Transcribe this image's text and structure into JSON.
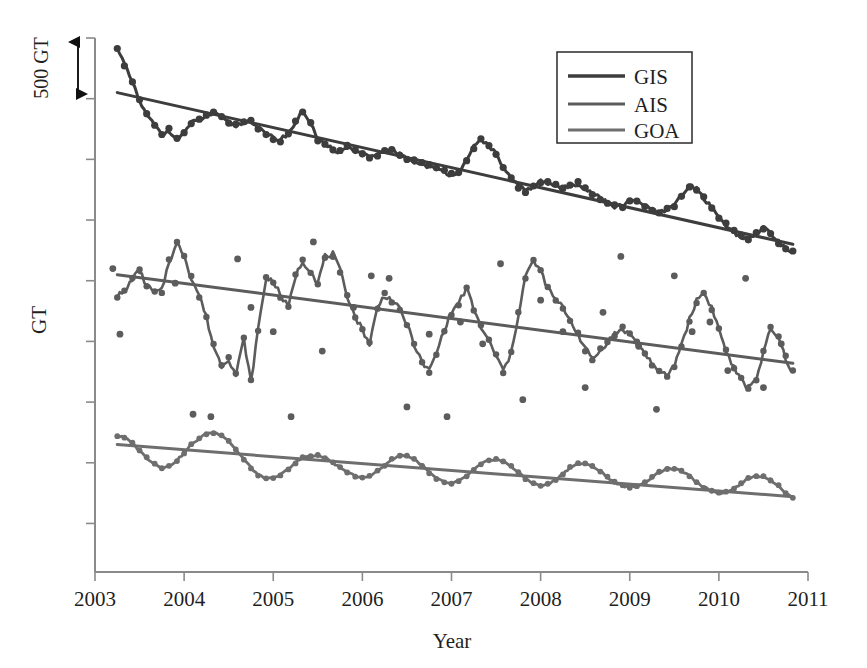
{
  "chart_data": {
    "type": "line",
    "title": "",
    "xlabel": "Year",
    "ylabel": "GT",
    "xlim": [
      2003,
      2011
    ],
    "ylim": [
      0,
      4400
    ],
    "grid": false,
    "legend_position": "top-right",
    "y_axis_note": "No numeric y tick labels; vertical scale indicated by a 500 GT double-headed arrow scale bar near the top of the axis",
    "scalebar": {
      "label": "500 GT",
      "value": 500,
      "units": "GT"
    },
    "xticks": [
      "2003",
      "2004",
      "2005",
      "2006",
      "2007",
      "2008",
      "2009",
      "2010",
      "2011"
    ],
    "yticks": [],
    "series": [
      {
        "name": "GIS",
        "color": "#3d3d3d",
        "style": "line+markers with linear trend line",
        "trend": {
          "start": 3950,
          "end": 2700
        },
        "x": [
          2003.25,
          2003.33,
          2003.42,
          2003.5,
          2003.58,
          2003.67,
          2003.75,
          2003.83,
          2003.92,
          2004.0,
          2004.08,
          2004.17,
          2004.25,
          2004.33,
          2004.42,
          2004.5,
          2004.58,
          2004.67,
          2004.75,
          2004.83,
          2004.92,
          2005.0,
          2005.08,
          2005.17,
          2005.25,
          2005.33,
          2005.42,
          2005.5,
          2005.58,
          2005.67,
          2005.75,
          2005.83,
          2005.92,
          2006.0,
          2006.08,
          2006.17,
          2006.25,
          2006.33,
          2006.42,
          2006.5,
          2006.58,
          2006.67,
          2006.75,
          2006.83,
          2006.92,
          2007.0,
          2007.08,
          2007.17,
          2007.25,
          2007.33,
          2007.42,
          2007.5,
          2007.58,
          2007.67,
          2007.75,
          2007.83,
          2007.92,
          2008.0,
          2008.08,
          2008.17,
          2008.25,
          2008.33,
          2008.42,
          2008.5,
          2008.58,
          2008.67,
          2008.75,
          2008.83,
          2008.92,
          2009.0,
          2009.08,
          2009.17,
          2009.25,
          2009.33,
          2009.42,
          2009.5,
          2009.58,
          2009.67,
          2009.75,
          2009.83,
          2009.92,
          2010.0,
          2010.08,
          2010.17,
          2010.25,
          2010.33,
          2010.42,
          2010.5,
          2010.58,
          2010.67,
          2010.75,
          2010.83
        ],
        "values": [
          4330,
          4180,
          4030,
          3880,
          3760,
          3680,
          3600,
          3640,
          3570,
          3620,
          3700,
          3720,
          3760,
          3780,
          3740,
          3700,
          3680,
          3700,
          3720,
          3660,
          3600,
          3580,
          3560,
          3620,
          3700,
          3800,
          3700,
          3560,
          3520,
          3480,
          3460,
          3500,
          3470,
          3440,
          3420,
          3430,
          3460,
          3480,
          3440,
          3400,
          3380,
          3360,
          3340,
          3320,
          3300,
          3270,
          3300,
          3380,
          3500,
          3560,
          3520,
          3440,
          3340,
          3240,
          3180,
          3140,
          3180,
          3220,
          3200,
          3180,
          3160,
          3180,
          3200,
          3160,
          3120,
          3080,
          3040,
          3010,
          3020,
          3050,
          3060,
          3020,
          2980,
          2960,
          2980,
          3020,
          3100,
          3180,
          3160,
          3080,
          3000,
          2920,
          2860,
          2800,
          2760,
          2740,
          2780,
          2840,
          2800,
          2720,
          2660,
          2640
        ]
      },
      {
        "name": "AIS",
        "color": "#5c5c5c",
        "style": "line+markers with scattered outlier points and linear trend line",
        "trend": {
          "start": 2450,
          "end": 1720
        },
        "x": [
          2003.25,
          2003.33,
          2003.42,
          2003.5,
          2003.58,
          2003.67,
          2003.75,
          2003.83,
          2003.92,
          2004.0,
          2004.08,
          2004.17,
          2004.25,
          2004.33,
          2004.42,
          2004.5,
          2004.58,
          2004.67,
          2004.75,
          2004.83,
          2004.92,
          2005.0,
          2005.08,
          2005.17,
          2005.25,
          2005.33,
          2005.42,
          2005.5,
          2005.58,
          2005.67,
          2005.75,
          2005.83,
          2005.92,
          2006.0,
          2006.08,
          2006.17,
          2006.25,
          2006.33,
          2006.42,
          2006.5,
          2006.58,
          2006.67,
          2006.75,
          2006.83,
          2006.92,
          2007.0,
          2007.08,
          2007.17,
          2007.25,
          2007.33,
          2007.42,
          2007.5,
          2007.58,
          2007.67,
          2007.75,
          2007.83,
          2007.92,
          2008.0,
          2008.08,
          2008.17,
          2008.25,
          2008.33,
          2008.42,
          2008.5,
          2008.58,
          2008.67,
          2008.75,
          2008.83,
          2008.92,
          2009.0,
          2009.08,
          2009.17,
          2009.25,
          2009.33,
          2009.42,
          2009.5,
          2009.58,
          2009.67,
          2009.75,
          2009.83,
          2009.92,
          2010.0,
          2010.08,
          2010.17,
          2010.25,
          2010.33,
          2010.42,
          2010.5,
          2010.58,
          2010.67,
          2010.75,
          2010.83
        ],
        "values": [
          2280,
          2300,
          2420,
          2480,
          2360,
          2300,
          2320,
          2560,
          2700,
          2620,
          2420,
          2280,
          2100,
          1860,
          1700,
          1760,
          1620,
          1920,
          1560,
          2000,
          2420,
          2400,
          2280,
          2180,
          2440,
          2560,
          2480,
          2380,
          2600,
          2620,
          2480,
          2280,
          2100,
          2000,
          1880,
          2180,
          2280,
          2240,
          2160,
          2040,
          1880,
          1720,
          1660,
          1800,
          2000,
          2140,
          2220,
          2340,
          2160,
          2020,
          1900,
          1780,
          1660,
          1800,
          2120,
          2440,
          2560,
          2480,
          2340,
          2240,
          2180,
          2080,
          1960,
          1840,
          1760,
          1820,
          1900,
          1960,
          2000,
          1960,
          1880,
          1800,
          1720,
          1640,
          1620,
          1700,
          1880,
          2080,
          2240,
          2300,
          2180,
          2000,
          1820,
          1680,
          1580,
          1520,
          1600,
          1800,
          2000,
          1920,
          1760,
          1640
        ],
        "outliers_x": [
          2003.2,
          2003.28,
          2003.9,
          2004.1,
          2004.3,
          2004.6,
          2004.75,
          2005.0,
          2005.2,
          2005.45,
          2005.55,
          2005.9,
          2006.1,
          2006.3,
          2006.5,
          2006.75,
          2006.95,
          2007.1,
          2007.35,
          2007.55,
          2007.8,
          2008.0,
          2008.25,
          2008.5,
          2008.7,
          2008.9,
          2009.1,
          2009.3,
          2009.5,
          2009.7,
          2009.9,
          2010.1,
          2010.3,
          2010.5,
          2010.7
        ],
        "outliers_y": [
          2500,
          1960,
          2380,
          1300,
          1280,
          2580,
          2180,
          1980,
          1280,
          2720,
          1820,
          2180,
          2440,
          2420,
          1360,
          1960,
          1280,
          2060,
          1880,
          2540,
          1420,
          2240,
          1980,
          1520,
          2140,
          2600,
          1860,
          1340,
          2440,
          1980,
          2060,
          1660,
          2420,
          1520,
          1880
        ]
      },
      {
        "name": "GOA",
        "color": "#6e6e6e",
        "style": "smooth annual oscillation with linear trend line",
        "trend": {
          "start": 1050,
          "end": 620
        },
        "x": [
          2003.25,
          2003.33,
          2003.42,
          2003.5,
          2003.58,
          2003.67,
          2003.75,
          2003.83,
          2003.92,
          2004.0,
          2004.08,
          2004.17,
          2004.25,
          2004.33,
          2004.42,
          2004.5,
          2004.58,
          2004.67,
          2004.75,
          2004.83,
          2004.92,
          2005.0,
          2005.08,
          2005.17,
          2005.25,
          2005.33,
          2005.42,
          2005.5,
          2005.58,
          2005.67,
          2005.75,
          2005.83,
          2005.92,
          2006.0,
          2006.08,
          2006.17,
          2006.25,
          2006.33,
          2006.42,
          2006.5,
          2006.58,
          2006.67,
          2006.75,
          2006.83,
          2006.92,
          2007.0,
          2007.08,
          2007.17,
          2007.25,
          2007.33,
          2007.42,
          2007.5,
          2007.58,
          2007.67,
          2007.75,
          2007.83,
          2007.92,
          2008.0,
          2008.08,
          2008.17,
          2008.25,
          2008.33,
          2008.42,
          2008.5,
          2008.58,
          2008.67,
          2008.75,
          2008.83,
          2008.92,
          2009.0,
          2009.08,
          2009.17,
          2009.25,
          2009.33,
          2009.42,
          2009.5,
          2009.58,
          2009.67,
          2009.75,
          2009.83,
          2009.92,
          2010.0,
          2010.08,
          2010.17,
          2010.25,
          2010.33,
          2010.42,
          2010.5,
          2010.58,
          2010.67,
          2010.75,
          2010.83
        ],
        "values": [
          1120,
          1110,
          1060,
          1000,
          940,
          890,
          860,
          870,
          920,
          980,
          1050,
          1100,
          1140,
          1150,
          1130,
          1080,
          1010,
          930,
          860,
          800,
          770,
          770,
          800,
          850,
          900,
          940,
          960,
          960,
          940,
          900,
          860,
          820,
          790,
          780,
          790,
          830,
          880,
          930,
          960,
          960,
          930,
          880,
          820,
          770,
          740,
          730,
          750,
          790,
          840,
          890,
          920,
          930,
          910,
          870,
          820,
          770,
          730,
          710,
          720,
          760,
          810,
          860,
          890,
          890,
          870,
          830,
          780,
          740,
          710,
          700,
          710,
          740,
          780,
          820,
          850,
          850,
          830,
          790,
          740,
          700,
          670,
          650,
          660,
          690,
          730,
          770,
          790,
          790,
          760,
          710,
          650,
          610
        ]
      }
    ]
  },
  "legend": {
    "items": [
      {
        "label": "GIS",
        "color": "#3d3d3d"
      },
      {
        "label": "AIS",
        "color": "#5c5c5c"
      },
      {
        "label": "GOA",
        "color": "#6e6e6e"
      }
    ]
  },
  "axes": {
    "x_title": "Year",
    "y_title": "GT",
    "x_ticks": [
      "2003",
      "2004",
      "2005",
      "2006",
      "2007",
      "2008",
      "2009",
      "2010",
      "2011"
    ],
    "scalebar_text": "500 GT"
  },
  "colors": {
    "gis": "#3d3d3d",
    "ais": "#5c5c5c",
    "goa": "#6e6e6e",
    "axis": "#8a8a8a",
    "text": "#1f1f1f",
    "background": "#ffffff"
  }
}
